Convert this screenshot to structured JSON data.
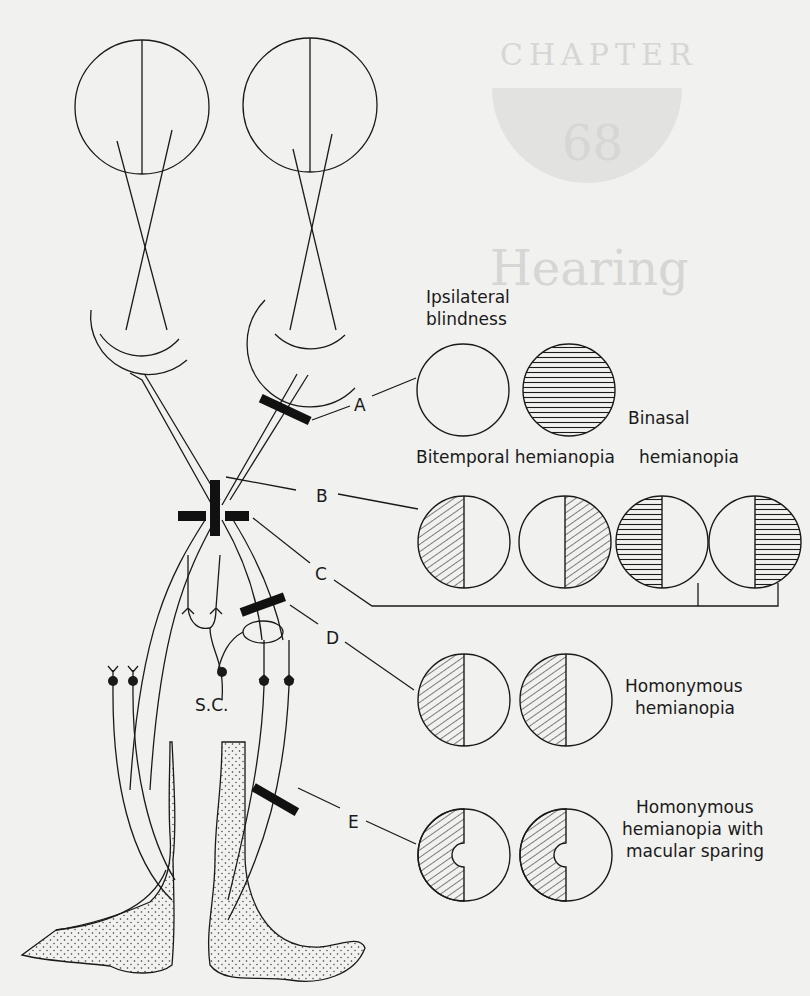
{
  "figure": {
    "background_ghost": {
      "chapter_word": "CHAPTER",
      "chapter_number": "68",
      "heading_word": "Hearing"
    },
    "lesion_labels": [
      "A",
      "B",
      "C",
      "D",
      "E"
    ],
    "structure_labels": {
      "superior_colliculus": "S.C."
    },
    "field_defects": {
      "A": {
        "line1": "Ipsilateral",
        "line2": "blindness"
      },
      "B": {
        "label": "Bitemporal hemianopia"
      },
      "C": {
        "line1": "Binasal",
        "line2": "hemianopia"
      },
      "D": {
        "line1": "Homonymous",
        "line2": "hemianopia"
      },
      "E": {
        "line1": "Homonymous",
        "line2": "hemianopia with",
        "line3": "macular sparing"
      }
    },
    "colors": {
      "ink": "#1a1a1a",
      "paper": "#f1f1ef",
      "ghost": "#d6d6d4"
    }
  }
}
